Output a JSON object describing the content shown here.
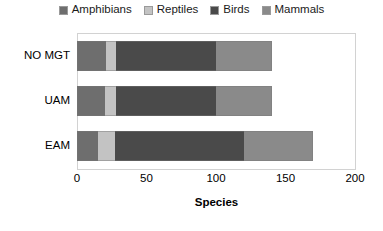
{
  "chart_data": {
    "type": "bar",
    "orientation": "horizontal",
    "stacked": true,
    "title": "",
    "xlabel": "Species",
    "ylabel": "",
    "xlim": [
      0,
      200
    ],
    "xticks": [
      0,
      50,
      100,
      150,
      200
    ],
    "grid": false,
    "legend_position": "top",
    "categories": [
      "NO MGT",
      "UAM",
      "EAM"
    ],
    "series": [
      {
        "name": "Amphibians",
        "color": "#6e6e6e",
        "values": [
          21,
          20,
          15
        ]
      },
      {
        "name": "Reptiles",
        "color": "#c3c3c3",
        "values": [
          7,
          8,
          12
        ]
      },
      {
        "name": "Birds",
        "color": "#4a4a4a",
        "values": [
          72,
          72,
          93
        ]
      },
      {
        "name": "Mammals",
        "color": "#8a8a8a",
        "values": [
          40,
          40,
          50
        ]
      }
    ],
    "totals": [
      140,
      140,
      170
    ]
  },
  "legend": {
    "items": [
      {
        "label": "Amphibians"
      },
      {
        "label": "Reptiles"
      },
      {
        "label": "Birds"
      },
      {
        "label": "Mammals"
      }
    ]
  },
  "axis": {
    "x_title": "Species",
    "x_tick_labels": [
      "0",
      "50",
      "100",
      "150",
      "200"
    ],
    "y_tick_labels": [
      "NO MGT",
      "UAM",
      "EAM"
    ]
  }
}
